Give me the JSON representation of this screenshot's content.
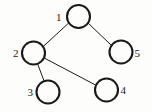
{
  "figure": {
    "kind": "undirected-graph-diagram",
    "caption": "",
    "background_color": "#fdfdfc",
    "ink_color": "#1a1a1a",
    "width": 152,
    "height": 112
  },
  "graph": {
    "node_radius": 11.5,
    "node_stroke_width": 2.1,
    "edge_stroke_width": 1.0,
    "nodes": [
      {
        "id": "1",
        "label": "1",
        "cx": 78.5,
        "cy": 16.5,
        "label_x": 61.5,
        "label_y": 20.5,
        "label_anchor": "end"
      },
      {
        "id": "2",
        "label": "2",
        "cx": 33.5,
        "cy": 53.0,
        "label_x": 18.5,
        "label_y": 57.0,
        "label_anchor": "end"
      },
      {
        "id": "3",
        "label": "3",
        "cx": 48.0,
        "cy": 92.0,
        "label_x": 33.0,
        "label_y": 96.0,
        "label_anchor": "end"
      },
      {
        "id": "4",
        "label": "4",
        "cx": 106.5,
        "cy": 90.0,
        "label_x": 120.5,
        "label_y": 94.0,
        "label_anchor": "start"
      },
      {
        "id": "5",
        "label": "5",
        "cx": 121.0,
        "cy": 52.0,
        "label_x": 134.5,
        "label_y": 56.5,
        "label_anchor": "start"
      }
    ],
    "edges": [
      {
        "id": "edge-1-2",
        "source": "1",
        "target": "2",
        "x1": 68.9,
        "y1": 22.8,
        "x2": 43.0,
        "y2": 46.7
      },
      {
        "id": "edge-1-5",
        "source": "1",
        "target": "5",
        "x1": 88.0,
        "y1": 23.0,
        "x2": 111.8,
        "y2": 45.7
      },
      {
        "id": "edge-2-3",
        "source": "2",
        "target": "3",
        "x1": 37.5,
        "y1": 63.6,
        "x2": 44.0,
        "y2": 80.8
      },
      {
        "id": "edge-2-4",
        "source": "2",
        "target": "4",
        "x1": 44.6,
        "y1": 58.2,
        "x2": 95.5,
        "y2": 85.0
      }
    ]
  }
}
